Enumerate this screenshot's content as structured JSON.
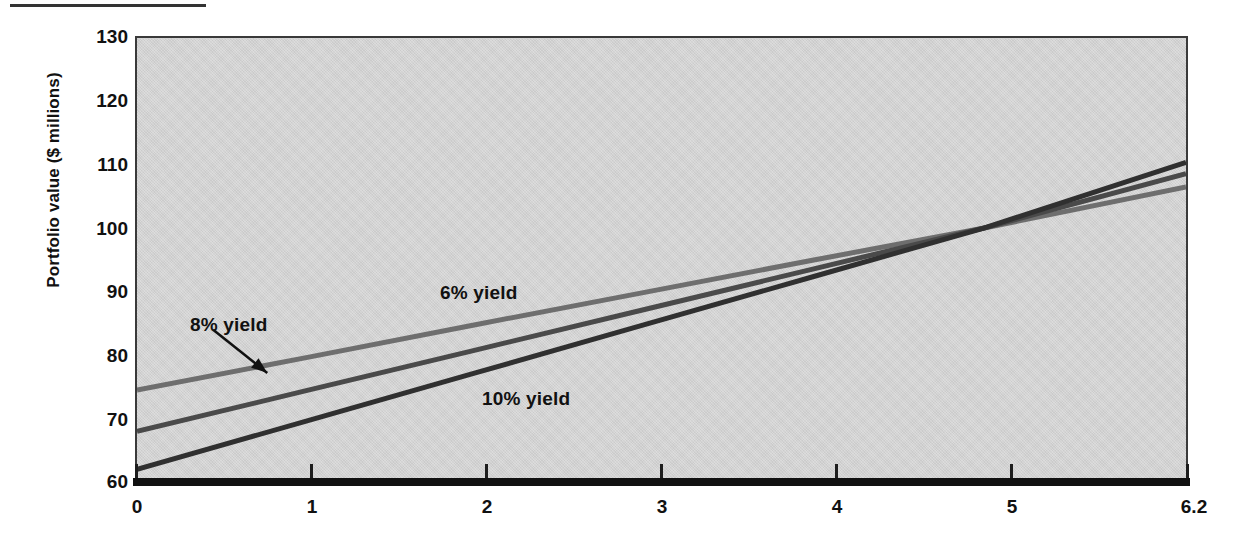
{
  "figure": {
    "top_rule": "",
    "background_color": "#d2d2d2",
    "frame_color": "#3a3a3a"
  },
  "axes": {
    "y_title": "Portfolio value ($ millions)",
    "y_ticks": [
      "130",
      "120",
      "110",
      "100",
      "90",
      "80",
      "70",
      "60"
    ],
    "x_ticks": [
      "0",
      "1",
      "2",
      "3",
      "4",
      "5",
      "6.2"
    ],
    "x_title": ""
  },
  "series_labels": {
    "six": "6% yield",
    "eight": "8% yield",
    "ten": "10% yield"
  },
  "chart_data": {
    "type": "line",
    "title": "",
    "xlabel": "",
    "ylabel": "Portfolio value ($ millions)",
    "xlim": [
      0,
      6.2
    ],
    "ylim": [
      60,
      130
    ],
    "xticks": [
      0,
      1,
      2,
      3,
      4,
      5,
      6.2
    ],
    "yticks": [
      60,
      70,
      80,
      90,
      100,
      110,
      120,
      130
    ],
    "grid": false,
    "legend": "inline-annotations",
    "crossing_point": {
      "x": 5.0,
      "y": 100.0
    },
    "series": [
      {
        "name": "6% yield",
        "color": "#6e6e6e",
        "linewidth": 5,
        "x": [
          0,
          1,
          2,
          3,
          4,
          5,
          6.2
        ],
        "values": [
          74.5,
          79.6,
          84.8,
          89.9,
          95.0,
          100.0,
          106.5
        ]
      },
      {
        "name": "8% yield",
        "color": "#4a4a4a",
        "linewidth": 5,
        "x": [
          0,
          1,
          2,
          3,
          4,
          5,
          6.2
        ],
        "values": [
          68.0,
          74.4,
          80.8,
          87.2,
          93.6,
          100.0,
          108.6
        ]
      },
      {
        "name": "10% yield",
        "color": "#303030",
        "linewidth": 5,
        "x": [
          0,
          1,
          2,
          3,
          4,
          5,
          6.2
        ],
        "values": [
          62.0,
          69.6,
          77.2,
          84.8,
          92.4,
          100.0,
          110.4
        ]
      }
    ],
    "annotations": [
      {
        "text": "6% yield",
        "x": 1.95,
        "y": 91.5,
        "arrow": false
      },
      {
        "text": "8% yield",
        "x": 0.35,
        "y": 86.5,
        "arrow": true,
        "arrow_from": {
          "x": 0.45,
          "y": 84.0
        },
        "arrow_to": {
          "x": 0.77,
          "y": 77.2
        }
      },
      {
        "text": "10% yield",
        "x": 2.2,
        "y": 75.0,
        "arrow": false
      }
    ]
  }
}
